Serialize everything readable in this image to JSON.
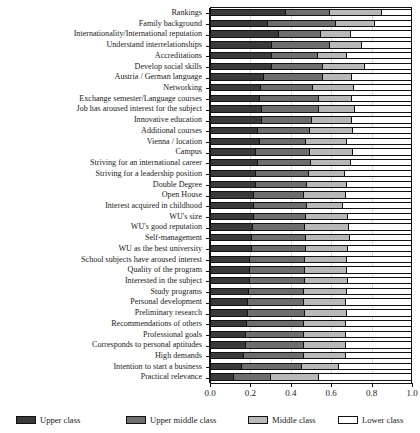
{
  "chart_data": {
    "type": "bar",
    "orientation": "horizontal",
    "stacked": true,
    "normalized": true,
    "title": "",
    "subtitle": "",
    "xlabel": "",
    "ylabel": "",
    "xlim": [
      0.0,
      1.0
    ],
    "xticks": [
      0.0,
      0.2,
      0.4,
      0.6,
      0.8,
      1.0
    ],
    "xticklabels": [
      "0.0",
      "0.2",
      "0.4",
      "0.6",
      "0.8",
      "1.0"
    ],
    "grid": true,
    "grid_axis": "x",
    "legend_position": "bottom",
    "legend": [
      "Upper class",
      "Upper middle class",
      "Middle class",
      "Lower class"
    ],
    "colors": [
      "#3a3a3a",
      "#6e6e6e",
      "#b9b9b9",
      "#ffffff"
    ],
    "categories": [
      "Rankings",
      "Family background",
      "Internationality/International reputation",
      "Understand interrelationships",
      "Accreditations",
      "Develop social skills",
      "Austria / German language",
      "Networking",
      "Exchange semester/Language courses",
      "Job has aroused interest for the subject",
      "Innovative education",
      "Additional courses",
      "Vienna / location",
      "Campus",
      "Striving for an international career",
      "Striving for a leadership position",
      "Double Degree",
      "Open House",
      "Interest acquired in childhood",
      "WU's size",
      "WU's good reputation",
      "Self-management",
      "WU as the best university",
      "School subjects have aroused interest",
      "Quality of the program",
      "Interested in the subject",
      "Study programs",
      "Personal development",
      "Preliminary research",
      "Recommendations of others",
      "Professional goals",
      "Corresponds to personal aptitudes",
      "High demands",
      "Intention to start a business",
      "Practical relevance"
    ],
    "series": [
      {
        "name": "Upper class",
        "values": [
          0.372,
          0.281,
          0.337,
          0.3,
          0.3,
          0.298,
          0.258,
          0.247,
          0.238,
          0.248,
          0.248,
          0.232,
          0.241,
          0.222,
          0.232,
          0.218,
          0.22,
          0.208,
          0.212,
          0.208,
          0.205,
          0.2,
          0.198,
          0.192,
          0.19,
          0.188,
          0.184,
          0.18,
          0.178,
          0.176,
          0.172,
          0.168,
          0.16,
          0.152,
          0.108
        ]
      },
      {
        "name": "Upper middle class",
        "values": [
          0.218,
          0.34,
          0.208,
          0.29,
          0.232,
          0.258,
          0.297,
          0.26,
          0.298,
          0.285,
          0.252,
          0.26,
          0.23,
          0.27,
          0.262,
          0.265,
          0.255,
          0.25,
          0.265,
          0.262,
          0.262,
          0.272,
          0.27,
          0.275,
          0.275,
          0.278,
          0.278,
          0.282,
          0.285,
          0.282,
          0.288,
          0.292,
          0.3,
          0.3,
          0.185
        ]
      },
      {
        "name": "Middle class",
        "values": [
          0.258,
          0.192,
          0.152,
          0.158,
          0.145,
          0.208,
          0.143,
          0.205,
          0.162,
          0.182,
          0.202,
          0.212,
          0.205,
          0.215,
          0.202,
          0.182,
          0.202,
          0.212,
          0.178,
          0.212,
          0.218,
          0.216,
          0.214,
          0.208,
          0.21,
          0.212,
          0.212,
          0.208,
          0.21,
          0.212,
          0.212,
          0.212,
          0.212,
          0.182,
          0.242
        ]
      },
      {
        "name": "Lower class",
        "values": [
          0.152,
          0.187,
          0.303,
          0.252,
          0.323,
          0.236,
          0.302,
          0.288,
          0.302,
          0.285,
          0.298,
          0.296,
          0.324,
          0.293,
          0.304,
          0.335,
          0.323,
          0.33,
          0.345,
          0.318,
          0.315,
          0.312,
          0.318,
          0.325,
          0.325,
          0.322,
          0.326,
          0.33,
          0.327,
          0.33,
          0.328,
          0.328,
          0.328,
          0.366,
          0.465
        ]
      }
    ]
  }
}
